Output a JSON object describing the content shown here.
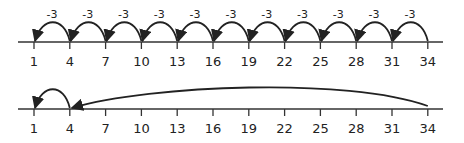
{
  "number_lines": [
    {
      "ticks": [
        "1",
        "4",
        "7",
        "10",
        "13",
        "16",
        "19",
        "22",
        "25",
        "28",
        "31",
        "34"
      ],
      "jumps": [
        {
          "from": "34",
          "to": "31",
          "label": "-3"
        },
        {
          "from": "31",
          "to": "28",
          "label": "-3"
        },
        {
          "from": "28",
          "to": "25",
          "label": "-3"
        },
        {
          "from": "25",
          "to": "22",
          "label": "-3"
        },
        {
          "from": "22",
          "to": "19",
          "label": "-3"
        },
        {
          "from": "19",
          "to": "16",
          "label": "-3"
        },
        {
          "from": "16",
          "to": "13",
          "label": "-3"
        },
        {
          "from": "13",
          "to": "10",
          "label": "-3"
        },
        {
          "from": "10",
          "to": "7",
          "label": "-3"
        },
        {
          "from": "7",
          "to": "4",
          "label": "-3"
        },
        {
          "from": "4",
          "to": "1",
          "label": "-3"
        }
      ]
    },
    {
      "ticks": [
        "1",
        "4",
        "7",
        "10",
        "13",
        "16",
        "19",
        "22",
        "25",
        "28",
        "31",
        "34"
      ],
      "jumps": [
        {
          "from": "34",
          "to": "4",
          "label": ""
        },
        {
          "from": "4",
          "to": "1",
          "label": ""
        }
      ]
    }
  ]
}
